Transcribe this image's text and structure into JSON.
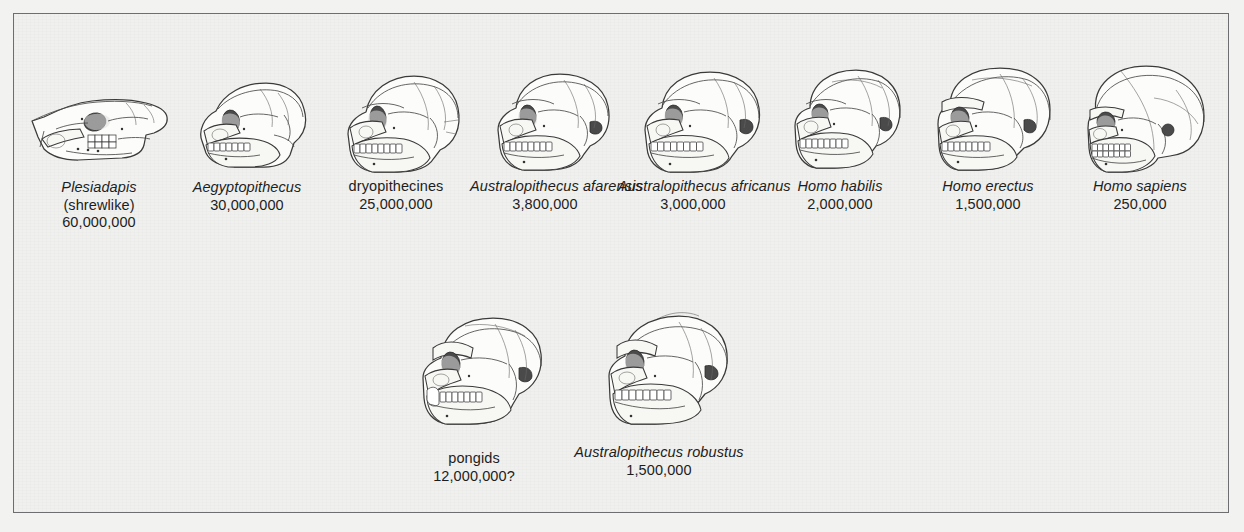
{
  "figure": {
    "title": "",
    "background_color": "#f2f2f0",
    "border_color": "#6e6e70",
    "rows": 2
  },
  "top_row": [
    {
      "id": "plesiadapis",
      "latin_name": "Plesiadapis",
      "common_name": "(shrewlike)",
      "date": "60,000,000",
      "italic": true,
      "skull_type": "elongated-low-snouted"
    },
    {
      "id": "aegyptopithecus",
      "latin_name": "Aegyptopithecus",
      "common_name": "",
      "date": "30,000,000",
      "italic": true,
      "skull_type": "small-prognathic-monkey"
    },
    {
      "id": "dryopithecines",
      "latin_name": "",
      "common_name": "dryopithecines",
      "date": "25,000,000",
      "italic": false,
      "skull_type": "ape-prognathic"
    },
    {
      "id": "australopithecus-afarensis",
      "latin_name": "Australopithecus afarensis",
      "common_name": "",
      "date": "3,800,000",
      "italic": true,
      "skull_type": "australopith"
    },
    {
      "id": "australopithecus-africanus",
      "latin_name": "Australopithecus africanus",
      "common_name": "",
      "date": "3,000,000",
      "italic": true,
      "skull_type": "australopith"
    },
    {
      "id": "homo-habilis",
      "latin_name": "Homo habilis",
      "common_name": "",
      "date": "2,000,000",
      "italic": true,
      "skull_type": "early-homo"
    },
    {
      "id": "homo-erectus",
      "latin_name": "Homo erectus",
      "common_name": "",
      "date": "1,500,000",
      "italic": true,
      "skull_type": "erectus-browridge"
    },
    {
      "id": "homo-sapiens",
      "latin_name": "Homo sapiens",
      "common_name": "",
      "date": "250,000",
      "italic": true,
      "skull_type": "modern-globular"
    }
  ],
  "bottom_row": [
    {
      "id": "pongids",
      "latin_name": "",
      "common_name": "pongids",
      "date": "12,000,000?",
      "italic": false,
      "skull_type": "great-ape-canines"
    },
    {
      "id": "australopithecus-robustus",
      "latin_name": "Australopithecus robustus",
      "common_name": "",
      "date": "1,500,000",
      "italic": true,
      "skull_type": "robust-sagittal-crest"
    }
  ]
}
